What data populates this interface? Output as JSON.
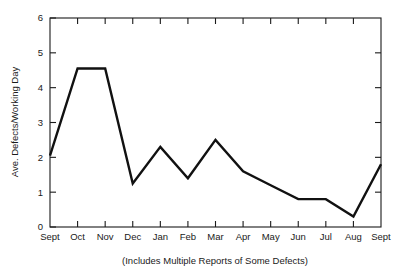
{
  "chart_data": {
    "type": "line",
    "title": "",
    "xlabel": "",
    "ylabel": "Ave. Defects/Working Day",
    "caption": "(Includes Multiple Reports of Some Defects)",
    "categories": [
      "Sept",
      "Oct",
      "Nov",
      "Dec",
      "Jan",
      "Feb",
      "Mar",
      "Apr",
      "May",
      "Jun",
      "Jul",
      "Aug",
      "Sept"
    ],
    "values": [
      2.05,
      4.55,
      4.55,
      1.25,
      2.3,
      1.4,
      2.5,
      1.6,
      1.2,
      0.8,
      0.8,
      0.3,
      1.8
    ],
    "ylim": [
      0,
      6
    ],
    "yticks": [
      0,
      1,
      2,
      3,
      4,
      5,
      6
    ],
    "ytick_labels": [
      "0",
      "1",
      "2",
      "3",
      "4",
      "5",
      "6"
    ],
    "grid": false,
    "legend": null,
    "series_color": "#111111",
    "frame_color": "#1a1a1a",
    "background": "#ffffff"
  }
}
